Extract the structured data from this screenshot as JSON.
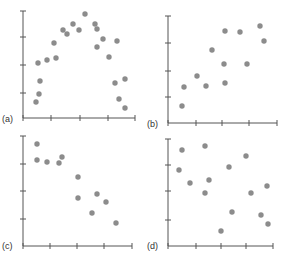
{
  "chart_data": [
    {
      "type": "scatter",
      "label": "(a)",
      "frame": {
        "x0": 23,
        "y0": 118,
        "x1": 135,
        "y1": 11
      },
      "yticks": [
        11,
        37,
        65,
        93
      ],
      "xticks": [
        23,
        51,
        80,
        108,
        135
      ],
      "points": [
        [
          36,
          102
        ],
        [
          39,
          94
        ],
        [
          40,
          81
        ],
        [
          38,
          63
        ],
        [
          47,
          60
        ],
        [
          56,
          58
        ],
        [
          54,
          43
        ],
        [
          63,
          30
        ],
        [
          67,
          34
        ],
        [
          73,
          24
        ],
        [
          79,
          30
        ],
        [
          85,
          14
        ],
        [
          95,
          24
        ],
        [
          97,
          29
        ],
        [
          97,
          47
        ],
        [
          103,
          39
        ],
        [
          109,
          57
        ],
        [
          117,
          41
        ],
        [
          115,
          83
        ],
        [
          125,
          79
        ],
        [
          119,
          99
        ],
        [
          125,
          108
        ]
      ]
    },
    {
      "type": "scatter",
      "label": "(b)",
      "frame": {
        "x0": 168,
        "y0": 123,
        "x1": 277,
        "y1": 16
      },
      "yticks": [
        16,
        43,
        71,
        97
      ],
      "xticks": [
        168,
        196,
        222,
        249,
        277
      ],
      "points": [
        [
          182,
          106
        ],
        [
          184,
          87
        ],
        [
          197,
          76
        ],
        [
          206,
          86
        ],
        [
          212,
          50
        ],
        [
          225,
          31
        ],
        [
          224,
          64
        ],
        [
          225,
          83
        ],
        [
          240,
          32
        ],
        [
          247,
          64
        ],
        [
          260,
          26
        ],
        [
          264,
          41
        ]
      ]
    },
    {
      "type": "scatter",
      "label": "(c)",
      "frame": {
        "x0": 23,
        "y0": 246,
        "x1": 132,
        "y1": 136
      },
      "yticks": [
        136,
        164,
        191,
        219
      ],
      "xticks": [
        23,
        50,
        77,
        104,
        132
      ],
      "points": [
        [
          37,
          144
        ],
        [
          37,
          160
        ],
        [
          47,
          162
        ],
        [
          59,
          163
        ],
        [
          62,
          157
        ],
        [
          78,
          177
        ],
        [
          78,
          198
        ],
        [
          97,
          194
        ],
        [
          106,
          202
        ],
        [
          92,
          213
        ],
        [
          116,
          223
        ]
      ]
    },
    {
      "type": "scatter",
      "label": "(d)",
      "frame": {
        "x0": 168,
        "y0": 246,
        "x1": 273,
        "y1": 139
      },
      "yticks": [
        139,
        165,
        191,
        220
      ],
      "xticks": [
        168,
        196,
        221,
        246,
        273
      ],
      "points": [
        [
          182,
          150
        ],
        [
          205,
          146
        ],
        [
          179,
          170
        ],
        [
          190,
          183
        ],
        [
          209,
          180
        ],
        [
          205,
          193
        ],
        [
          229,
          167
        ],
        [
          246,
          156
        ],
        [
          251,
          193
        ],
        [
          267,
          186
        ],
        [
          232,
          212
        ],
        [
          261,
          215
        ],
        [
          268,
          224
        ],
        [
          221,
          231
        ]
      ]
    }
  ],
  "labels": {
    "a": "(a)",
    "b": "(b)",
    "c": "(c)",
    "d": "(d)"
  },
  "colors": {
    "dot": "#8c8c8c",
    "axis": "#555555"
  }
}
